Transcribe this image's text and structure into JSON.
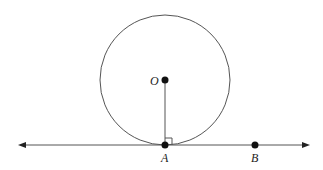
{
  "diagram": {
    "type": "geometry",
    "circle": {
      "center_label": "O",
      "cx": 165,
      "cy": 80,
      "r": 65
    },
    "points": [
      {
        "label": "O",
        "x": 165,
        "y": 80
      },
      {
        "label": "A",
        "x": 165,
        "y": 145
      },
      {
        "label": "B",
        "x": 255,
        "y": 145
      }
    ],
    "line": {
      "x1": 18,
      "x2": 310,
      "y": 145,
      "arrows": "both"
    },
    "segment": {
      "from": "O",
      "to": "A"
    },
    "right_angle_marker_at": "A",
    "colors": {
      "stroke": "#555555",
      "point": "#111111",
      "text": "#222222"
    }
  },
  "labels": {
    "O": "O",
    "A": "A",
    "B": "B"
  }
}
